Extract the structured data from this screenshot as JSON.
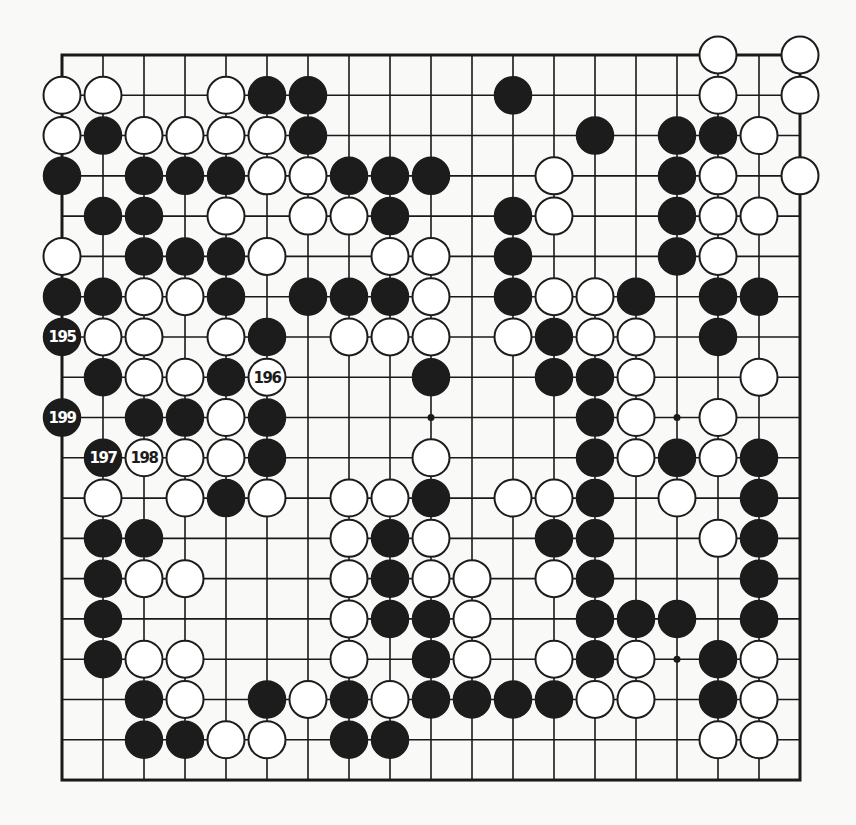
{
  "board": {
    "size": 19,
    "origin_x": 62,
    "origin_y": 55,
    "spacing_x": 41,
    "spacing_y": 40.28,
    "stone_radius": 18.5,
    "colors": {
      "line": "#1a1a1a",
      "black_stone": "#1c1c1c",
      "white_stone": "#ffffff",
      "background": "#f9f9f8"
    },
    "hoshi": [
      [
        9,
        9
      ],
      [
        9,
        15
      ],
      [
        15,
        15
      ]
    ],
    "stones": {
      "black": [
        [
          1,
          5
        ],
        [
          1,
          6
        ],
        [
          1,
          11
        ],
        [
          2,
          1
        ],
        [
          2,
          6
        ],
        [
          2,
          13
        ],
        [
          2,
          15
        ],
        [
          2,
          16
        ],
        [
          3,
          0
        ],
        [
          3,
          2
        ],
        [
          3,
          3
        ],
        [
          3,
          4
        ],
        [
          3,
          7
        ],
        [
          3,
          8
        ],
        [
          3,
          9
        ],
        [
          3,
          15
        ],
        [
          4,
          1
        ],
        [
          4,
          2
        ],
        [
          4,
          8
        ],
        [
          4,
          11
        ],
        [
          4,
          15
        ],
        [
          5,
          2
        ],
        [
          5,
          3
        ],
        [
          5,
          4
        ],
        [
          5,
          11
        ],
        [
          5,
          15
        ],
        [
          6,
          0
        ],
        [
          6,
          1
        ],
        [
          6,
          4
        ],
        [
          6,
          6
        ],
        [
          6,
          7
        ],
        [
          6,
          8
        ],
        [
          6,
          11
        ],
        [
          6,
          14
        ],
        [
          6,
          16
        ],
        [
          6,
          17
        ],
        [
          7,
          5
        ],
        [
          7,
          12
        ],
        [
          7,
          16
        ],
        [
          8,
          1
        ],
        [
          8,
          4
        ],
        [
          8,
          9
        ],
        [
          8,
          12
        ],
        [
          8,
          13
        ],
        [
          9,
          2
        ],
        [
          9,
          3
        ],
        [
          9,
          5
        ],
        [
          9,
          13
        ],
        [
          10,
          5
        ],
        [
          10,
          13
        ],
        [
          10,
          15
        ],
        [
          10,
          17
        ],
        [
          11,
          4
        ],
        [
          11,
          9
        ],
        [
          11,
          13
        ],
        [
          11,
          17
        ],
        [
          12,
          1
        ],
        [
          12,
          2
        ],
        [
          12,
          8
        ],
        [
          12,
          12
        ],
        [
          12,
          13
        ],
        [
          12,
          17
        ],
        [
          13,
          1
        ],
        [
          13,
          8
        ],
        [
          13,
          13
        ],
        [
          13,
          17
        ],
        [
          14,
          1
        ],
        [
          14,
          8
        ],
        [
          14,
          9
        ],
        [
          14,
          13
        ],
        [
          14,
          14
        ],
        [
          14,
          15
        ],
        [
          14,
          17
        ],
        [
          15,
          1
        ],
        [
          15,
          9
        ],
        [
          15,
          13
        ],
        [
          15,
          16
        ],
        [
          16,
          2
        ],
        [
          16,
          5
        ],
        [
          16,
          7
        ],
        [
          16,
          9
        ],
        [
          16,
          10
        ],
        [
          16,
          11
        ],
        [
          16,
          12
        ],
        [
          16,
          16
        ],
        [
          17,
          2
        ],
        [
          17,
          3
        ],
        [
          17,
          7
        ],
        [
          17,
          8
        ]
      ],
      "white": [
        [
          0,
          16
        ],
        [
          0,
          18
        ],
        [
          1,
          0
        ],
        [
          1,
          1
        ],
        [
          1,
          4
        ],
        [
          1,
          16
        ],
        [
          1,
          18
        ],
        [
          2,
          0
        ],
        [
          2,
          2
        ],
        [
          2,
          3
        ],
        [
          2,
          4
        ],
        [
          2,
          5
        ],
        [
          2,
          17
        ],
        [
          3,
          5
        ],
        [
          3,
          6
        ],
        [
          3,
          12
        ],
        [
          3,
          16
        ],
        [
          3,
          18
        ],
        [
          4,
          4
        ],
        [
          4,
          6
        ],
        [
          4,
          7
        ],
        [
          4,
          12
        ],
        [
          4,
          16
        ],
        [
          4,
          17
        ],
        [
          5,
          0
        ],
        [
          5,
          5
        ],
        [
          5,
          8
        ],
        [
          5,
          9
        ],
        [
          5,
          16
        ],
        [
          6,
          2
        ],
        [
          6,
          3
        ],
        [
          6,
          9
        ],
        [
          6,
          12
        ],
        [
          6,
          13
        ],
        [
          7,
          1
        ],
        [
          7,
          2
        ],
        [
          7,
          4
        ],
        [
          7,
          7
        ],
        [
          7,
          8
        ],
        [
          7,
          9
        ],
        [
          7,
          11
        ],
        [
          7,
          13
        ],
        [
          7,
          14
        ],
        [
          8,
          2
        ],
        [
          8,
          3
        ],
        [
          8,
          14
        ],
        [
          8,
          17
        ],
        [
          9,
          4
        ],
        [
          9,
          14
        ],
        [
          9,
          16
        ],
        [
          10,
          3
        ],
        [
          10,
          4
        ],
        [
          10,
          9
        ],
        [
          10,
          14
        ],
        [
          10,
          16
        ],
        [
          11,
          1
        ],
        [
          11,
          3
        ],
        [
          11,
          5
        ],
        [
          11,
          7
        ],
        [
          11,
          8
        ],
        [
          11,
          11
        ],
        [
          11,
          12
        ],
        [
          11,
          15
        ],
        [
          12,
          7
        ],
        [
          12,
          9
        ],
        [
          12,
          16
        ],
        [
          13,
          2
        ],
        [
          13,
          3
        ],
        [
          13,
          7
        ],
        [
          13,
          9
        ],
        [
          13,
          10
        ],
        [
          13,
          12
        ],
        [
          14,
          7
        ],
        [
          14,
          10
        ],
        [
          15,
          2
        ],
        [
          15,
          3
        ],
        [
          15,
          7
        ],
        [
          15,
          10
        ],
        [
          15,
          12
        ],
        [
          15,
          14
        ],
        [
          15,
          17
        ],
        [
          16,
          3
        ],
        [
          16,
          6
        ],
        [
          16,
          8
        ],
        [
          16,
          13
        ],
        [
          16,
          14
        ],
        [
          16,
          17
        ],
        [
          17,
          4
        ],
        [
          17,
          5
        ],
        [
          17,
          16
        ],
        [
          17,
          17
        ]
      ]
    },
    "numbered_moves": [
      {
        "number": "195",
        "color": "black",
        "row": 7,
        "col": 0
      },
      {
        "number": "196",
        "color": "white",
        "row": 8,
        "col": 5
      },
      {
        "number": "197",
        "color": "black",
        "row": 10,
        "col": 1
      },
      {
        "number": "198",
        "color": "white",
        "row": 10,
        "col": 2
      },
      {
        "number": "199",
        "color": "black",
        "row": 9,
        "col": 0
      }
    ]
  }
}
